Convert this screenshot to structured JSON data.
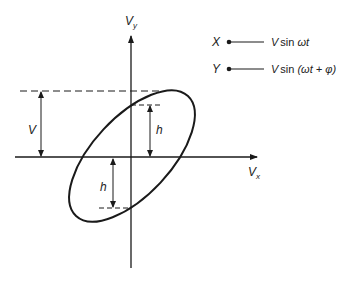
{
  "diagram": {
    "axes": {
      "y_label": "V",
      "y_label_sub": "y",
      "x_label": "V",
      "x_label_sub": "x"
    },
    "dimensions": {
      "amplitude_label": "V",
      "intercept_label_upper": "h",
      "intercept_label_lower": "h"
    },
    "legend": {
      "items": [
        {
          "channel": "X",
          "signal_prefix": "V",
          "signal_fn": "sin",
          "signal_arg": "ωt"
        },
        {
          "channel": "Y",
          "signal_prefix": "V",
          "signal_fn": "sin",
          "signal_arg": "(ωt + φ)"
        }
      ]
    },
    "colors": {
      "stroke": "#1a1a1a",
      "background": "#ffffff"
    }
  }
}
